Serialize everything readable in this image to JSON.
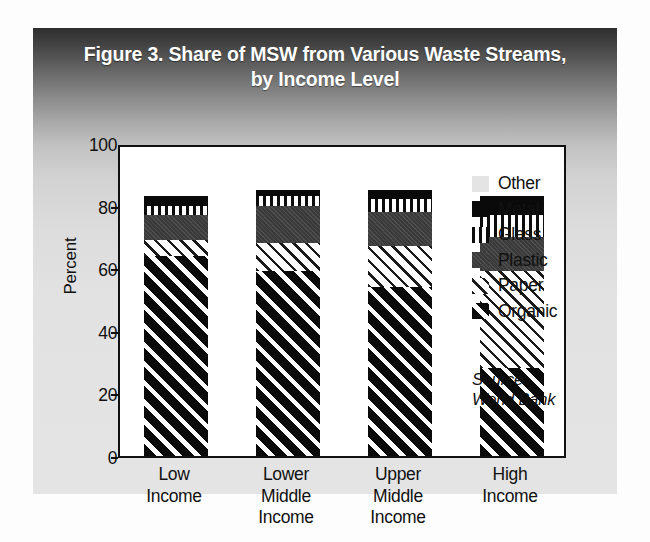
{
  "figure": {
    "title_line1": "Figure 3. Share of MSW from Various Waste Streams,",
    "title_line2": "by Income Level",
    "source_line1": "Source:",
    "source_line2": "World Bank"
  },
  "axes": {
    "y_axis_title": "Percent",
    "y_ticks": [
      "100",
      "80",
      "60",
      "40",
      "20",
      "0"
    ]
  },
  "legend": {
    "items": [
      {
        "label": "Other",
        "pattern": "other"
      },
      {
        "label": "Metal",
        "pattern": "metal"
      },
      {
        "label": "Glass",
        "pattern": "glass"
      },
      {
        "label": "Plastic",
        "pattern": "plastic"
      },
      {
        "label": "Paper",
        "pattern": "paper"
      },
      {
        "label": "Organic",
        "pattern": "organic"
      }
    ]
  },
  "chart_data": {
    "type": "bar",
    "subtype": "stacked-vertical",
    "title": "Figure 3. Share of MSW from Various Waste Streams, by Income Level",
    "xlabel": "",
    "ylabel": "Percent",
    "ylim": [
      0,
      100
    ],
    "yticks": [
      0,
      20,
      40,
      60,
      80,
      100
    ],
    "grid": false,
    "legend_position": "right-inside",
    "source": "World Bank",
    "categories": [
      "Low Income",
      "Lower Middle Income",
      "Upper Middle Income",
      "High Income"
    ],
    "category_lines": [
      [
        "Low",
        "Income"
      ],
      [
        "Lower",
        "Middle",
        "Income"
      ],
      [
        "Upper",
        "Middle",
        "Income"
      ],
      [
        "High",
        "Income"
      ]
    ],
    "series": [
      {
        "name": "Organic",
        "values": [
          64,
          59,
          54,
          28
        ]
      },
      {
        "name": "Paper",
        "values": [
          5,
          9,
          13,
          31
        ]
      },
      {
        "name": "Plastic",
        "values": [
          8,
          12,
          11,
          11
        ]
      },
      {
        "name": "Glass",
        "values": [
          3,
          3,
          4,
          7
        ]
      },
      {
        "name": "Metal",
        "values": [
          3,
          2,
          3,
          6
        ]
      },
      {
        "name": "Other",
        "values": [
          17,
          15,
          15,
          17
        ]
      }
    ],
    "bars": [
      {
        "category": "Low Income",
        "segments": [
          {
            "name": "Organic",
            "value": 64,
            "cum_top": 64
          },
          {
            "name": "Paper",
            "value": 5,
            "cum_top": 69
          },
          {
            "name": "Plastic",
            "value": 8,
            "cum_top": 77
          },
          {
            "name": "Glass",
            "value": 3,
            "cum_top": 80
          },
          {
            "name": "Metal",
            "value": 3,
            "cum_top": 83
          }
        ]
      },
      {
        "category": "Lower Middle Income",
        "segments": [
          {
            "name": "Organic",
            "value": 59,
            "cum_top": 59
          },
          {
            "name": "Paper",
            "value": 9,
            "cum_top": 68
          },
          {
            "name": "Plastic",
            "value": 12,
            "cum_top": 80
          },
          {
            "name": "Glass",
            "value": 3,
            "cum_top": 83
          },
          {
            "name": "Metal",
            "value": 2,
            "cum_top": 85
          }
        ]
      },
      {
        "category": "Upper Middle Income",
        "segments": [
          {
            "name": "Organic",
            "value": 54,
            "cum_top": 54
          },
          {
            "name": "Paper",
            "value": 13,
            "cum_top": 67
          },
          {
            "name": "Plastic",
            "value": 11,
            "cum_top": 78
          },
          {
            "name": "Glass",
            "value": 4,
            "cum_top": 82
          },
          {
            "name": "Metal",
            "value": 3,
            "cum_top": 85
          }
        ]
      },
      {
        "category": "High Income",
        "segments": [
          {
            "name": "Organic",
            "value": 28,
            "cum_top": 28
          },
          {
            "name": "Paper",
            "value": 31,
            "cum_top": 59
          },
          {
            "name": "Plastic",
            "value": 11,
            "cum_top": 70
          },
          {
            "name": "Glass",
            "value": 7,
            "cum_top": 77
          },
          {
            "name": "Metal",
            "value": 6,
            "cum_top": 83
          }
        ]
      }
    ]
  },
  "colors": {
    "ink": "#111111",
    "panel_top": "#2e2e2e",
    "panel_bottom": "#e4e4e4",
    "plot_bg": "#ffffff",
    "other": "#e8e8e8",
    "metal": "#0a0a0a",
    "plastic": "#3a3a3a"
  }
}
